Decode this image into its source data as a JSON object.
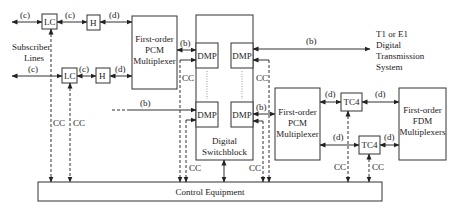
{
  "diagram": {
    "labels": {
      "subscriber_lines": [
        "Subscriber",
        "Lines"
      ],
      "lc": "LC",
      "h": "H",
      "pcm_mux": [
        "First-order",
        "PCM",
        "Multiplexer"
      ],
      "dmp": "DMP",
      "switchblock": [
        "Digital",
        "Switchblock"
      ],
      "tc4": "TC4",
      "fdm_mux": [
        "First-order",
        "FDM",
        "Multiplexers"
      ],
      "control_equipment": "Control Equipment",
      "transmission": [
        "T1 or E1",
        "Digital",
        "Transmission",
        "System"
      ],
      "cc": "CC",
      "link_b": "(b)",
      "link_c": "(c)",
      "link_d": "(d)"
    },
    "colors": {
      "stroke": "#333333",
      "text": "#1a1a1a",
      "background": "#ffffff"
    }
  }
}
